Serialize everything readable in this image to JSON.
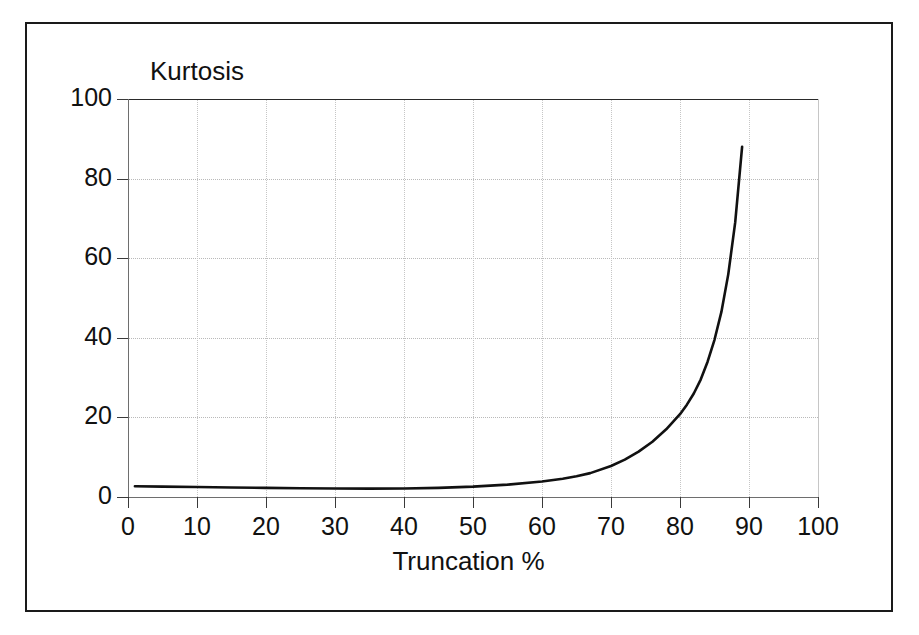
{
  "figure": {
    "background_color": "#ffffff",
    "frame_color": "#1a1a1a",
    "axis_color": "#6e6e6e",
    "grid_color": "#c6c6c6",
    "curve_color": "#111111"
  },
  "chart_data": {
    "type": "line",
    "title": "",
    "xlabel": "Truncation %",
    "ylabel": "Kurtosis",
    "xlim": [
      0,
      100
    ],
    "ylim": [
      0,
      100
    ],
    "xticks": [
      0,
      10,
      20,
      30,
      40,
      50,
      60,
      70,
      80,
      90,
      100
    ],
    "xtick_labels": [
      "0",
      "10",
      "20",
      "30",
      "40",
      "50",
      "60",
      "70",
      "80",
      "90",
      "100"
    ],
    "yticks": [
      0,
      20,
      40,
      60,
      80,
      100
    ],
    "ytick_labels": [
      "0",
      "20",
      "40",
      "60",
      "80",
      "100"
    ],
    "grid": "dotted both axes",
    "legend": "none",
    "series": [
      {
        "name": "Kurtosis vs Truncation %",
        "x": [
          1,
          5,
          10,
          15,
          20,
          25,
          30,
          35,
          40,
          45,
          50,
          55,
          60,
          63,
          65,
          67,
          70,
          72,
          74,
          76,
          78,
          80,
          81,
          82,
          83,
          84,
          85,
          86,
          87,
          88,
          89
        ],
        "y": [
          2.7,
          2.6,
          2.5,
          2.4,
          2.3,
          2.2,
          2.15,
          2.1,
          2.15,
          2.3,
          2.6,
          3.1,
          3.9,
          4.6,
          5.2,
          6.0,
          7.8,
          9.4,
          11.4,
          13.9,
          17.0,
          20.8,
          23.2,
          26.0,
          29.5,
          34.0,
          39.5,
          46.5,
          56.0,
          69.0,
          88.0
        ]
      }
    ]
  }
}
